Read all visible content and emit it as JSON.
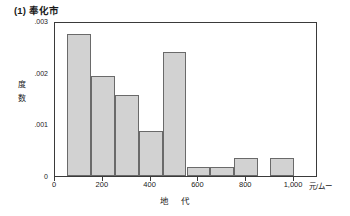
{
  "chart_data": {
    "type": "bar",
    "title": "(1) 奉化市",
    "xlabel": "地 代",
    "ylabel": "度数",
    "xunit": "元/ムー",
    "xlim": [
      0,
      1100
    ],
    "ylim": [
      0,
      0.003
    ],
    "grid": false,
    "legend": null,
    "bin_width": 100,
    "xticks": [
      0,
      200,
      400,
      600,
      800,
      1000
    ],
    "xtick_labels": [
      "0",
      "200",
      "400",
      "600",
      "800",
      "1,000"
    ],
    "yticks": [
      0,
      0.001,
      0.002,
      0.003
    ],
    "ytick_labels": [
      "0",
      ".001",
      ".002",
      ".003"
    ],
    "bin_edges": [
      50,
      150,
      250,
      350,
      450,
      550,
      650,
      750,
      850,
      950,
      1050
    ],
    "bars": [
      {
        "x0": 50,
        "x1": 150,
        "value": 0.00275
      },
      {
        "x0": 150,
        "x1": 250,
        "value": 0.00193
      },
      {
        "x0": 250,
        "x1": 350,
        "value": 0.00157
      },
      {
        "x0": 350,
        "x1": 450,
        "value": 0.00088
      },
      {
        "x0": 450,
        "x1": 550,
        "value": 0.0024
      },
      {
        "x0": 550,
        "x1": 650,
        "value": 0.00018
      },
      {
        "x0": 650,
        "x1": 750,
        "value": 0.00018
      },
      {
        "x0": 750,
        "x1": 850,
        "value": 0.00035
      },
      {
        "x0": 900,
        "x1": 1000,
        "value": 0.00035
      }
    ],
    "bar_fill": "#d2d2d2",
    "bar_edge": "#6a6a6a",
    "axis_color": "#3a3a3a"
  }
}
